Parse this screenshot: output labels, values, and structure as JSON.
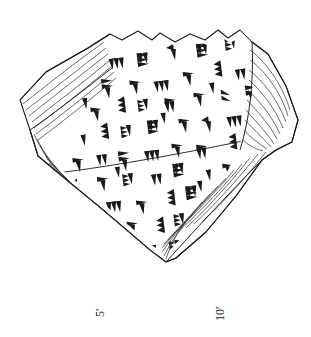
{
  "figure": {
    "kind": "cuneiform-tablet-hand-copy",
    "title": "",
    "caption": "",
    "background_color": "#ffffff",
    "ink_color": "#1a1a1a",
    "hatch_color": "#555555"
  },
  "labels": {
    "line_numbers": [
      {
        "id": "label-5",
        "text": "5'",
        "x": 100,
        "y": 313,
        "rotation_deg": -90
      },
      {
        "id": "label-10",
        "text": "10'",
        "x": 220,
        "y": 314,
        "rotation_deg": -90
      }
    ]
  },
  "tablet": {
    "name": "tablet-fragment",
    "outline_description": "irregular polygonal fragment, jagged broken top edge, hatched broken edges at upper-left, left tip, right side and lower-right",
    "broken_edges": [
      {
        "name": "break-edge-upper-left",
        "hatch_lines": 9
      },
      {
        "name": "break-edge-left-tip",
        "hatch_lines": 8
      },
      {
        "name": "break-edge-right",
        "hatch_lines": 12
      },
      {
        "name": "break-edge-lower-right",
        "hatch_lines": 11
      }
    ],
    "rulings": [
      {
        "name": "ruling-line-1"
      }
    ],
    "inscription": {
      "script": "cuneiform",
      "sign_count_approx": 120,
      "rows": 13,
      "note": "dense columns of wedge signs covering the obverse face"
    }
  }
}
